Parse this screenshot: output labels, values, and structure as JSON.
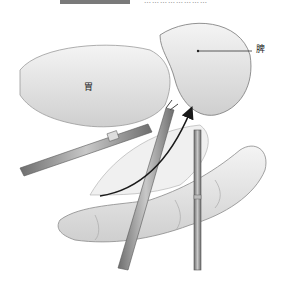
{
  "caption": {
    "bar_color": "#7a7a7a",
    "text": "……………………"
  },
  "labels": {
    "stomach": "胃",
    "spleen": "脾"
  },
  "colors": {
    "background": "#ffffff",
    "line": "#333333",
    "tissue_shade": "#d9d9d9",
    "instrument": "#8a8a8a",
    "arrow": "#1a1a1a"
  }
}
